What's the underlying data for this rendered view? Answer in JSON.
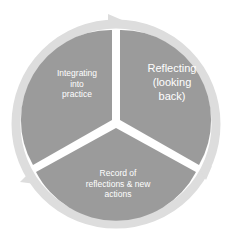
{
  "diagram": {
    "type": "cycle",
    "segments": [
      {
        "label": "Reflecting (looking back)",
        "lines": [
          "Reflecting",
          "(looking",
          "back)"
        ]
      },
      {
        "label": "Record of reflections & new actions",
        "lines": [
          "Record of",
          "reflections & new",
          "actions"
        ]
      },
      {
        "label": "Integrating into practice",
        "lines": [
          "Integrating",
          "into",
          "practice"
        ]
      }
    ],
    "colors": {
      "segment": "#9b9b9b",
      "ring": "#dcdcdc",
      "text": "#ffffff"
    }
  }
}
